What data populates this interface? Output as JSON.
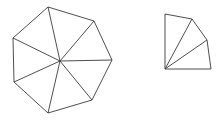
{
  "canvas": {
    "width": 223,
    "height": 120,
    "background_color": "#ffffff"
  },
  "style": {
    "stroke_color": "#3a3a3a",
    "stroke_width": 0.9,
    "fill_color": "none"
  },
  "figures": [
    {
      "id": "heptagon-fan",
      "name": "triangulated-heptagon",
      "shape": "heptagon",
      "side_count": 7,
      "triangle_count": 7,
      "center": {
        "x": 60,
        "y": 61
      },
      "vertices": [
        {
          "x": 48,
          "y": 7
        },
        {
          "x": 94,
          "y": 21
        },
        {
          "x": 112,
          "y": 60
        },
        {
          "x": 92,
          "y": 100
        },
        {
          "x": 48,
          "y": 113
        },
        {
          "x": 14,
          "y": 82
        },
        {
          "x": 13,
          "y": 38
        }
      ],
      "outline_path": "M 48 7 L 94 21 L 112 60 L 92 100 L 48 113 L 14 82 L 13 38 Z",
      "spokes": [
        "M 60 61 L 48 7",
        "M 60 61 L 94 21",
        "M 60 61 L 112 60",
        "M 60 61 L 92 100",
        "M 60 61 L 48 113",
        "M 60 61 L 14 82",
        "M 60 61 L 13 38"
      ]
    },
    {
      "id": "sector-fan",
      "name": "triangulated-sector",
      "shape": "quarter-sector",
      "side_count": 5,
      "triangle_count": 3,
      "apex": {
        "x": 165,
        "y": 69
      },
      "vertices": [
        {
          "x": 165,
          "y": 69
        },
        {
          "x": 165,
          "y": 14
        },
        {
          "x": 192,
          "y": 19
        },
        {
          "x": 207,
          "y": 40
        },
        {
          "x": 211,
          "y": 69
        }
      ],
      "outline_path": "M 165 69 L 165 14 L 192 19 L 207 40 L 211 69 Z",
      "spokes": [
        "M 165 69 L 192 19",
        "M 165 69 L 207 40"
      ]
    }
  ]
}
